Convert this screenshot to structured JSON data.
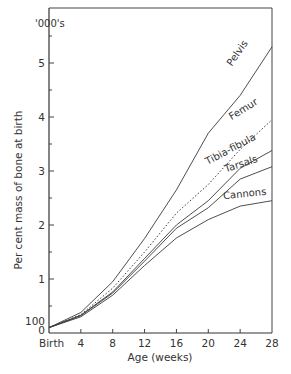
{
  "chart_data": {
    "type": "line",
    "title": "",
    "xlabel": "Age (weeks)",
    "ylabel": "Per cent mass of bone at birth",
    "y_unit_label": "'000's",
    "x": [
      0,
      4,
      8,
      12,
      16,
      20,
      24,
      28
    ],
    "x_tick_labels": [
      "Birth",
      "4",
      "8",
      "12",
      "16",
      "20",
      "24",
      "28"
    ],
    "y_tick_labels": [
      "0",
      "100",
      "1",
      "2",
      "3",
      "4",
      "5"
    ],
    "y_ticks_value": [
      0,
      100,
      1000,
      2000,
      3000,
      4000,
      5000
    ],
    "xlim": [
      0,
      28
    ],
    "ylim": [
      0,
      5800
    ],
    "grid": false,
    "legend_position": "inline labels at line ends",
    "series": [
      {
        "name": "Pelvis",
        "style": "solid",
        "values": [
          100,
          380,
          950,
          1750,
          2650,
          3700,
          4400,
          5300
        ]
      },
      {
        "name": "Femur",
        "style": "dotted",
        "values": [
          100,
          340,
          830,
          1500,
          2220,
          2750,
          3400,
          3950
        ]
      },
      {
        "name": "Tibia-fibula",
        "style": "solid",
        "values": [
          100,
          330,
          760,
          1380,
          2000,
          2450,
          3050,
          3380
        ]
      },
      {
        "name": "Tarsals",
        "style": "solid",
        "values": [
          100,
          320,
          740,
          1330,
          1940,
          2320,
          2850,
          3080
        ]
      },
      {
        "name": "Cannons",
        "style": "solid",
        "values": [
          100,
          300,
          700,
          1250,
          1760,
          2100,
          2350,
          2450
        ]
      }
    ]
  }
}
